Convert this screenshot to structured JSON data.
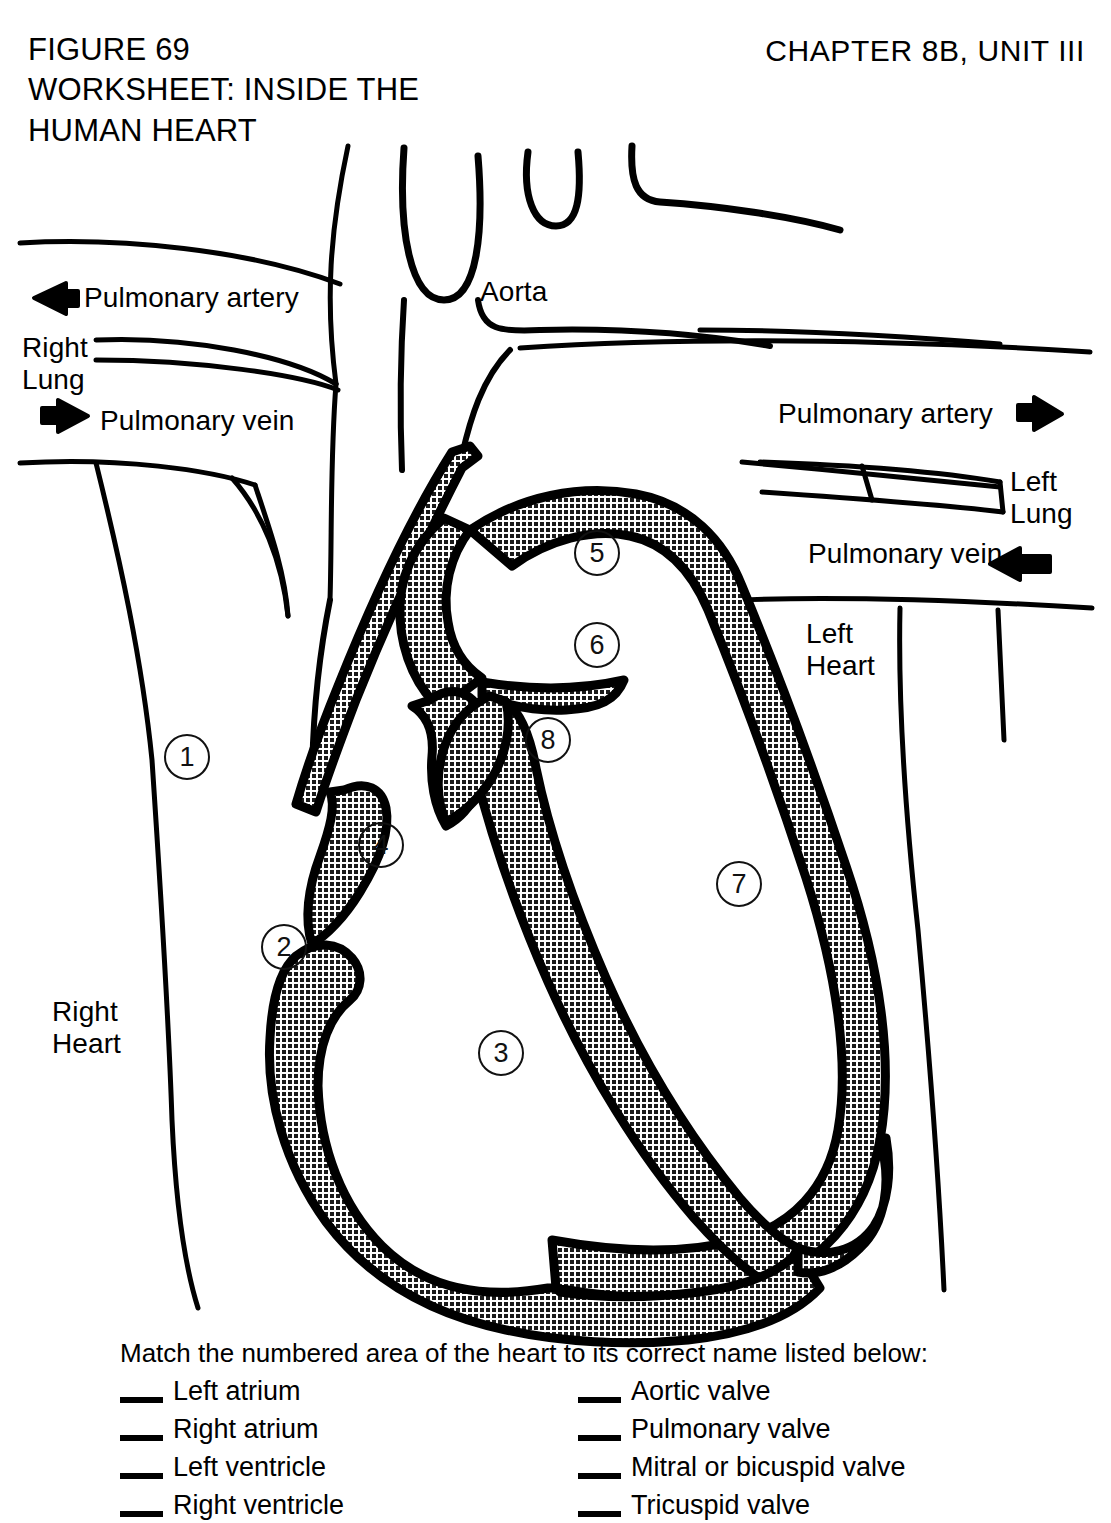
{
  "header": {
    "figure_title": "FIGURE 69\nWORKSHEET: INSIDE THE\nHUMAN HEART",
    "chapter_unit": "CHAPTER 8B, UNIT III"
  },
  "diagram": {
    "labels": {
      "aorta": "Aorta",
      "pulmonary_artery_left": "Pulmonary artery",
      "right_lung": "Right\nLung",
      "pulmonary_vein_left": "Pulmonary vein",
      "pulmonary_artery_right": "Pulmonary artery",
      "left_lung": "Left\nLung",
      "pulmonary_vein_right": "Pulmonary vein",
      "left_heart": "Left\nHeart",
      "right_heart": "Right\nHeart"
    },
    "arrows": {
      "pulmonary_artery_left_direction": "left",
      "pulmonary_vein_left_direction": "right",
      "pulmonary_artery_right_direction": "right",
      "pulmonary_vein_right_direction": "left"
    },
    "callouts": [
      {
        "number": "1",
        "x": 164,
        "y": 734
      },
      {
        "number": "2",
        "x": 261,
        "y": 924
      },
      {
        "number": "3",
        "x": 478,
        "y": 1030
      },
      {
        "number": "4",
        "x": 358,
        "y": 822
      },
      {
        "number": "5",
        "x": 574,
        "y": 530
      },
      {
        "number": "6",
        "x": 574,
        "y": 622
      },
      {
        "number": "7",
        "x": 716,
        "y": 861
      },
      {
        "number": "8",
        "x": 525,
        "y": 717
      }
    ],
    "colors": {
      "ink": "#000000",
      "muscle_fill": "#4a4a4a",
      "background": "#ffffff"
    }
  },
  "matching": {
    "instruction": "Match the numbered area of the heart to its correct name listed below:",
    "left_column": [
      "Left atrium",
      "Right atrium",
      "Left ventricle",
      "Right ventricle"
    ],
    "right_column": [
      "Aortic valve",
      "Pulmonary valve",
      "Mitral or bicuspid valve",
      "Tricuspid valve"
    ]
  }
}
